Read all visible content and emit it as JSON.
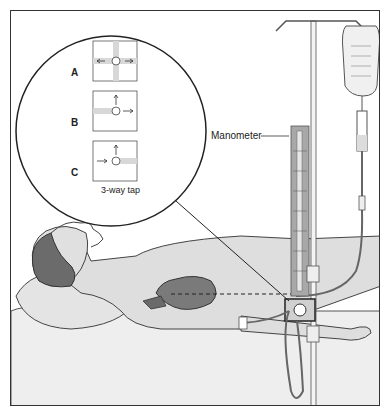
{
  "figure": {
    "inset": {
      "panels": [
        {
          "label": "A"
        },
        {
          "label": "B"
        },
        {
          "label": "C"
        }
      ],
      "caption": "3-way tap"
    },
    "manometer_label": "Manometer",
    "colors": {
      "outline": "#333333",
      "skin": "#d9d9d9",
      "hair": "#6b6b6b",
      "heart": "#7a7a7a",
      "manometer": "#a8a8a8",
      "background": "#ffffff"
    }
  }
}
